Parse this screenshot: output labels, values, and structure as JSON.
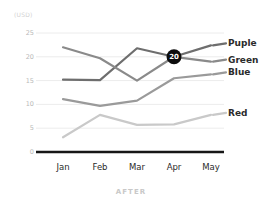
{
  "caption": "AFTER",
  "unit_label": "(USD)",
  "chart_data": {
    "type": "line",
    "title": "",
    "xlabel": "",
    "ylabel": "(USD)",
    "categories": [
      "Jan",
      "Feb",
      "Mar",
      "Apr",
      "May"
    ],
    "ylim": [
      0,
      25
    ],
    "yticks": [
      0,
      5,
      10,
      15,
      20,
      25
    ],
    "ytick_labels": [
      "0",
      "5",
      "10",
      "15",
      "20",
      "25"
    ],
    "grid": true,
    "legend_position": "right",
    "series": [
      {
        "name": "Puple",
        "color": "#6e6e6e",
        "values": [
          15.2,
          15.1,
          21.8,
          20.0,
          22.4
        ]
      },
      {
        "name": "Green",
        "color": "#8a8a8a",
        "values": [
          22.0,
          19.7,
          15.0,
          20.0,
          19.0
        ]
      },
      {
        "name": "Blue",
        "color": "#9a9a9a",
        "values": [
          11.1,
          9.7,
          10.8,
          15.5,
          16.3
        ]
      },
      {
        "name": "Red",
        "color": "#c9c9c9",
        "values": [
          3.1,
          7.8,
          5.7,
          5.8,
          7.8
        ]
      }
    ],
    "annotations": [
      {
        "label": "20",
        "x": "Apr",
        "y": 20,
        "style": "dark-circle-badge"
      }
    ]
  }
}
